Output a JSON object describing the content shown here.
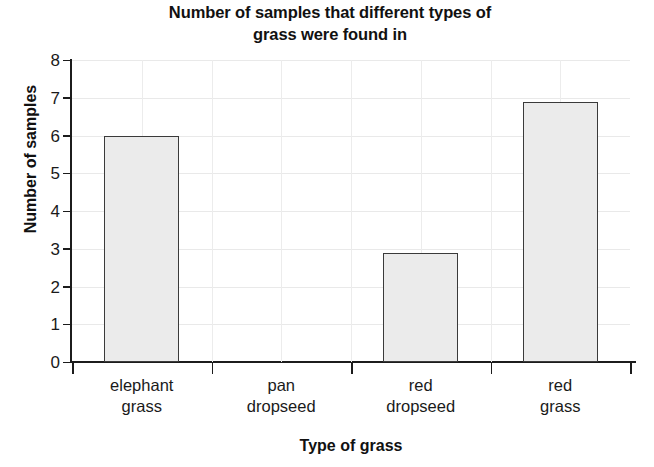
{
  "chart_data": {
    "type": "bar",
    "title": "Number of samples that different types of\ngrass were found in",
    "title_line1": "Number of samples that different types of",
    "title_line2": "grass were found in",
    "xlabel": "Type of grass",
    "ylabel": "Number of samples",
    "categories": [
      "elephant grass",
      "pan dropseed",
      "red dropseed",
      "red grass"
    ],
    "category_lines": [
      [
        "elephant",
        "grass"
      ],
      [
        "pan",
        "dropseed"
      ],
      [
        "red",
        "dropseed"
      ],
      [
        "red",
        "grass"
      ]
    ],
    "values": [
      6,
      0,
      2.9,
      6.9
    ],
    "ylim": [
      0,
      8
    ],
    "ytick_labels": [
      "8",
      "7",
      "6",
      "5",
      "4",
      "3",
      "2",
      "1",
      "0"
    ],
    "ytick_values": [
      8,
      7,
      6,
      5,
      4,
      3,
      2,
      1,
      0
    ],
    "grid": true,
    "legend": "none",
    "bar_fill_color": "#ebebeb",
    "bar_border_color": "#3a3a3a",
    "axis_color": "#1c1c1c",
    "grid_color": "#e9e9e9",
    "text_color": "#1a1a1a"
  }
}
